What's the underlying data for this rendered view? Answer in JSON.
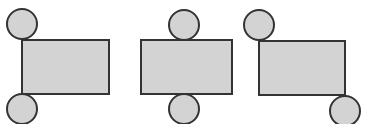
{
  "diagram": {
    "type": "cylinder-nets",
    "colors": {
      "fill": "#d3d3d3",
      "stroke": "#333333",
      "background": "#ffffff"
    },
    "stroke_width": 2,
    "nets": [
      {
        "label": "net-1",
        "rect": {
          "x": 22,
          "y": 40,
          "w": 87,
          "h": 54
        },
        "circles": [
          {
            "cx": 22,
            "cy": 24,
            "r": 15
          },
          {
            "cx": 22,
            "cy": 109,
            "r": 15
          }
        ]
      },
      {
        "label": "net-2",
        "rect": {
          "x": 141,
          "y": 40,
          "w": 91,
          "h": 54
        },
        "circles": [
          {
            "cx": 184,
            "cy": 25,
            "r": 15
          },
          {
            "cx": 184,
            "cy": 109,
            "r": 15
          }
        ]
      },
      {
        "label": "net-3",
        "rect": {
          "x": 259,
          "y": 41,
          "w": 86,
          "h": 54
        },
        "circles": [
          {
            "cx": 259,
            "cy": 25,
            "r": 15
          },
          {
            "cx": 345,
            "cy": 111,
            "r": 15
          }
        ]
      }
    ]
  }
}
